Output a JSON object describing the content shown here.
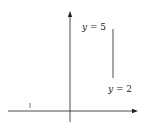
{
  "diagram": {
    "type": "function-graph",
    "axes": {
      "x_label": "x",
      "y_label": "y",
      "x_ticks": [
        {
          "value": -1,
          "label": "−1"
        },
        {
          "value": 0,
          "label": "0"
        },
        {
          "value": 1,
          "label": "1"
        }
      ],
      "y_ticks": [
        {
          "value": 2,
          "label": "2"
        },
        {
          "value": 3,
          "label": "3"
        },
        {
          "value": 4,
          "label": "4"
        },
        {
          "value": 5,
          "label": "5"
        }
      ]
    },
    "curves": [
      {
        "name": "y = 5^x",
        "label_prefix": "y = 5",
        "label_exp": "x"
      },
      {
        "name": "y = 2^x",
        "label_prefix": "y = 2",
        "label_exp": "x"
      }
    ],
    "shaded_region": {
      "x_from": -1,
      "x_to": 1,
      "between": [
        "5^x",
        "2^x"
      ],
      "color": "#b8b8b8"
    }
  }
}
